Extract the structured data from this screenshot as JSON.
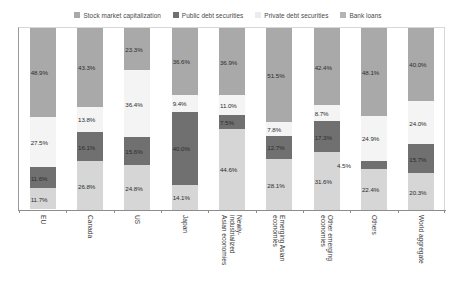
{
  "chart_data": {
    "type": "bar",
    "subtype": "stacked-100-percent-vertical",
    "title": "",
    "subtitle": "",
    "xlabel": "",
    "ylabel": "",
    "ylim": [
      0,
      100
    ],
    "grid": false,
    "legend_position": "top-center",
    "categories": [
      "EU",
      "Canada",
      "US",
      "Japan",
      "Newly-\nindustrialized\nAsian economies",
      "Emerging Asian\neconomies",
      "Other emerging\neconomies",
      "Others",
      "World aggregate"
    ],
    "series": [
      {
        "name": "Stock market capitalization",
        "color": "#a9a9a9",
        "values": [
          48.9,
          43.3,
          23.3,
          36.6,
          36.9,
          51.5,
          42.4,
          48.1,
          40.0
        ],
        "labels": [
          "48.9%",
          "43.3%",
          "23.3%",
          "36.6%",
          "36.9%",
          "51.5%",
          "42.4%",
          "48.1%",
          "40.0%"
        ]
      },
      {
        "name": "Public debt securities",
        "color": "#f4f4f4",
        "values": [
          27.5,
          13.8,
          36.4,
          9.4,
          11.0,
          7.8,
          8.7,
          24.9,
          24.0
        ],
        "labels": [
          "27.5%",
          "13.8%",
          "36.4%",
          "9.4%",
          "11.0%",
          "7.8%",
          "8.7%",
          "24.9%",
          "24.0%"
        ]
      },
      {
        "name": "Private debt securities",
        "color": "#707070",
        "values": [
          11.6,
          16.1,
          15.6,
          40.0,
          7.5,
          12.7,
          17.3,
          4.5,
          15.7
        ],
        "labels": [
          "11.6%",
          "16.1%",
          "15.6%",
          "40.0%",
          "7.5%",
          "12.7%",
          "17.3%",
          "4.5%",
          "15.7%"
        ]
      },
      {
        "name": "Bank loans",
        "color": "#d6d6d6",
        "values": [
          11.7,
          26.8,
          24.8,
          14.1,
          44.6,
          28.1,
          31.6,
          22.4,
          20.3
        ],
        "labels": [
          "11.7%",
          "26.8%",
          "24.8%",
          "14.1%",
          "44.6%",
          "28.1%",
          "31.6%",
          "22.4%",
          "20.3%"
        ]
      }
    ]
  },
  "legend": {
    "items": [
      {
        "label": "Stock market capitalization",
        "color": "#a9a9a9"
      },
      {
        "label": "Public debt securities",
        "color": "#707070"
      },
      {
        "label": "Private debt securities",
        "color": "#ececec"
      },
      {
        "label": "Bank loans",
        "color": "#b4b4b4"
      }
    ]
  }
}
